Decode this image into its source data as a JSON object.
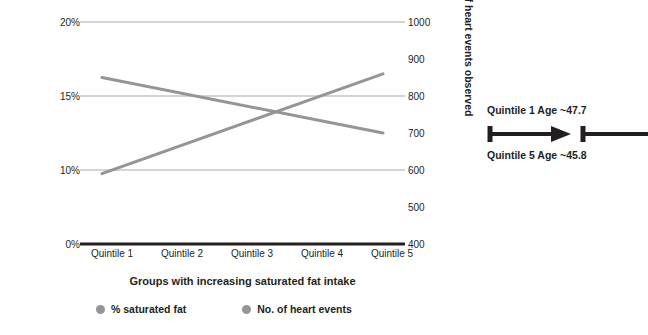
{
  "chart_data": {
    "type": "line",
    "title": "",
    "xlabel": "Groups with increasing saturated fat intake",
    "categories": [
      "Quintile 1",
      "Quintile 2",
      "Quintile 3",
      "Quintile 4",
      "Quintile 5"
    ],
    "grid": true,
    "legend_position": "bottom",
    "axes": {
      "left": {
        "label": "% saturated fat in diet",
        "ticks": [
          "20%",
          "15%",
          "10%",
          "0%"
        ],
        "tick_values": [
          20,
          15,
          10,
          0
        ],
        "ylim": [
          0,
          20
        ]
      },
      "right": {
        "label": "Number of heart events observed",
        "ticks": [
          "1000",
          "900",
          "800",
          "700",
          "600",
          "500",
          "400"
        ],
        "tick_values": [
          1000,
          900,
          800,
          700,
          600,
          500,
          400
        ],
        "ylim": [
          400,
          1000
        ]
      }
    },
    "series": [
      {
        "name": "% saturated fat",
        "axis": "left",
        "color": "#939598",
        "values": [
          15.0,
          13.75,
          12.5,
          11.25,
          10.0
        ]
      },
      {
        "name": "No. of heart events",
        "axis": "right",
        "color": "#939598",
        "values": [
          590,
          657,
          725,
          792,
          860
        ]
      }
    ],
    "gridlines": [
      {
        "left_label": "20%",
        "right_label": "1000"
      },
      {
        "left_label": "15%",
        "right_label": "800"
      },
      {
        "left_label": "10%",
        "right_label": "600"
      },
      {
        "left_label": "0%",
        "right_label": "400"
      }
    ]
  },
  "legend": {
    "items": [
      {
        "label": "% saturated fat",
        "color": "#939598"
      },
      {
        "label": "No. of heart events",
        "color": "#939598"
      }
    ]
  },
  "annotation": {
    "top_text": "Quintile 1 Age ~47.7",
    "bottom_text": "Quintile 5 Age ~45.8",
    "color": "#231f20"
  },
  "colors": {
    "text": "#231f20",
    "gridline": "#a7a9ac",
    "baseline": "#231f20",
    "series": "#939598"
  }
}
